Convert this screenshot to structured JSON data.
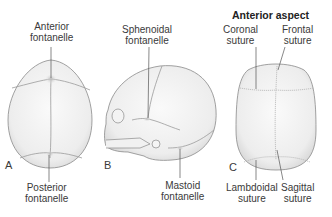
{
  "figure": {
    "panels": [
      {
        "id": "A",
        "view": "superior",
        "labels": [
          "Anterior fontanelle",
          "Posterior fontanelle"
        ]
      },
      {
        "id": "B",
        "view": "lateral",
        "labels": [
          "Sphenoidal fontanelle",
          "Mastoid fontanelle"
        ]
      },
      {
        "id": "C",
        "view": "anterior",
        "title": "Anterior aspect",
        "labels": [
          "Coronal suture",
          "Frontal suture",
          "Lambdoidal suture",
          "Sagittal suture"
        ]
      }
    ]
  },
  "labels": {
    "anterior_fontanelle": {
      "l1": "Anterior",
      "l2": "fontanelle"
    },
    "posterior_fontanelle": {
      "l1": "Posterior",
      "l2": "fontanelle"
    },
    "sphenoidal_fontanelle": {
      "l1": "Sphenoidal",
      "l2": "fontanelle"
    },
    "mastoid_fontanelle": {
      "l1": "Mastoid",
      "l2": "fontanelle"
    },
    "coronal_suture": {
      "l1": "Coronal",
      "l2": "suture"
    },
    "frontal_suture": {
      "l1": "Frontal",
      "l2": "suture"
    },
    "lambdoidal_suture": {
      "l1": "Lambdoidal",
      "l2": "suture"
    },
    "sagittal_suture": {
      "l1": "Sagittal",
      "l2": "suture"
    }
  },
  "panel_letters": {
    "a": "A",
    "b": "B",
    "c": "C"
  },
  "panel_c_title": "Anterior aspect",
  "colors": {
    "bone_fill": "#eeeeee",
    "outline": "#8a8a8a",
    "suture": "#9a9a9a",
    "leader": "#555555",
    "text": "#3a3a3a"
  }
}
